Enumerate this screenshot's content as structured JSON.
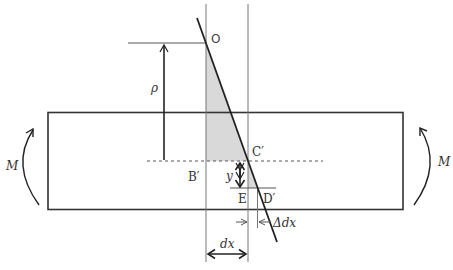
{
  "diagram": {
    "labels": {
      "O": "O",
      "rho": "ρ",
      "C_prime": "C′",
      "B_prime": "B′",
      "y": "y",
      "E": "E",
      "D_prime": "D′",
      "M_left": "M",
      "M_right": "M",
      "dx": "dx",
      "delta_dx": "Δdx"
    },
    "colors": {
      "line": "#222222",
      "thin_line": "#777777",
      "shade": "#d9d9d9",
      "text": "#333333"
    }
  }
}
